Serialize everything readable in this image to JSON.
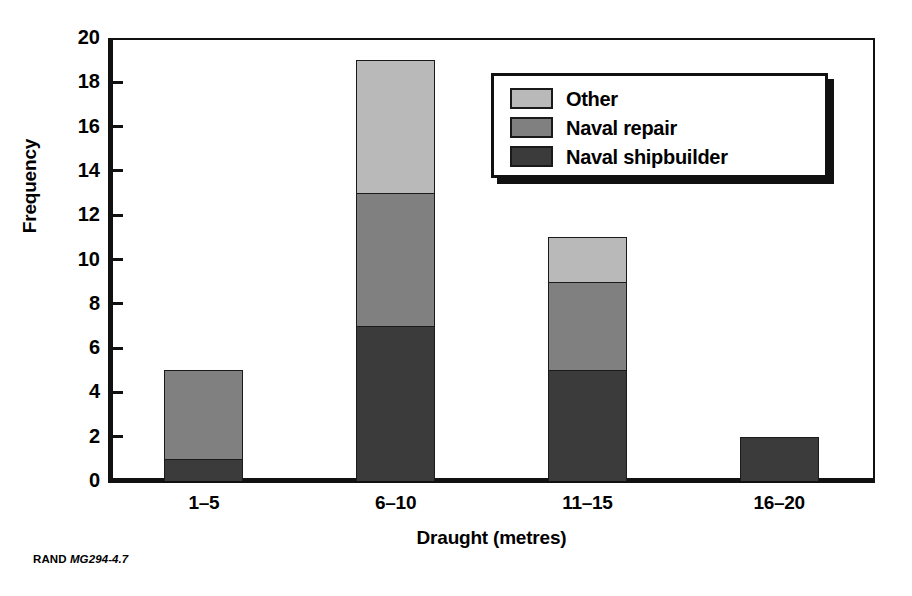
{
  "chart_data": {
    "type": "bar",
    "subtype": "stacked-vertical",
    "title": "",
    "xlabel": "Draught (metres)",
    "ylabel": "Frequency",
    "categories": [
      "1–5",
      "6–10",
      "11–15",
      "16–20"
    ],
    "series": [
      {
        "name": "Naval shipbuilder",
        "values": [
          1,
          7,
          5,
          2
        ],
        "color": "#3b3b3b"
      },
      {
        "name": "Naval repair",
        "values": [
          4,
          6,
          4,
          0
        ],
        "color": "#808080"
      },
      {
        "name": "Other",
        "values": [
          0,
          6,
          2,
          0
        ],
        "color": "#b9b9b9"
      }
    ],
    "totals": [
      5,
      19,
      11,
      2
    ],
    "ylim": [
      0,
      20
    ],
    "yticks": [
      0,
      2,
      4,
      6,
      8,
      10,
      12,
      14,
      16,
      18,
      20
    ],
    "ytick_labels": [
      "0",
      "2",
      "4",
      "6",
      "8",
      "10",
      "12",
      "14",
      "16",
      "18",
      "20"
    ],
    "grid": false,
    "legend_position": "upper right",
    "legend_order": [
      "Other",
      "Naval repair",
      "Naval shipbuilder"
    ]
  },
  "legend": {
    "entries": [
      {
        "label": "Other",
        "color": "#b9b9b9"
      },
      {
        "label": "Naval repair",
        "color": "#808080"
      },
      {
        "label": "Naval shipbuilder",
        "color": "#3b3b3b"
      }
    ]
  },
  "footer": {
    "source": "RAND",
    "figure_id": "MG294-4.7"
  }
}
